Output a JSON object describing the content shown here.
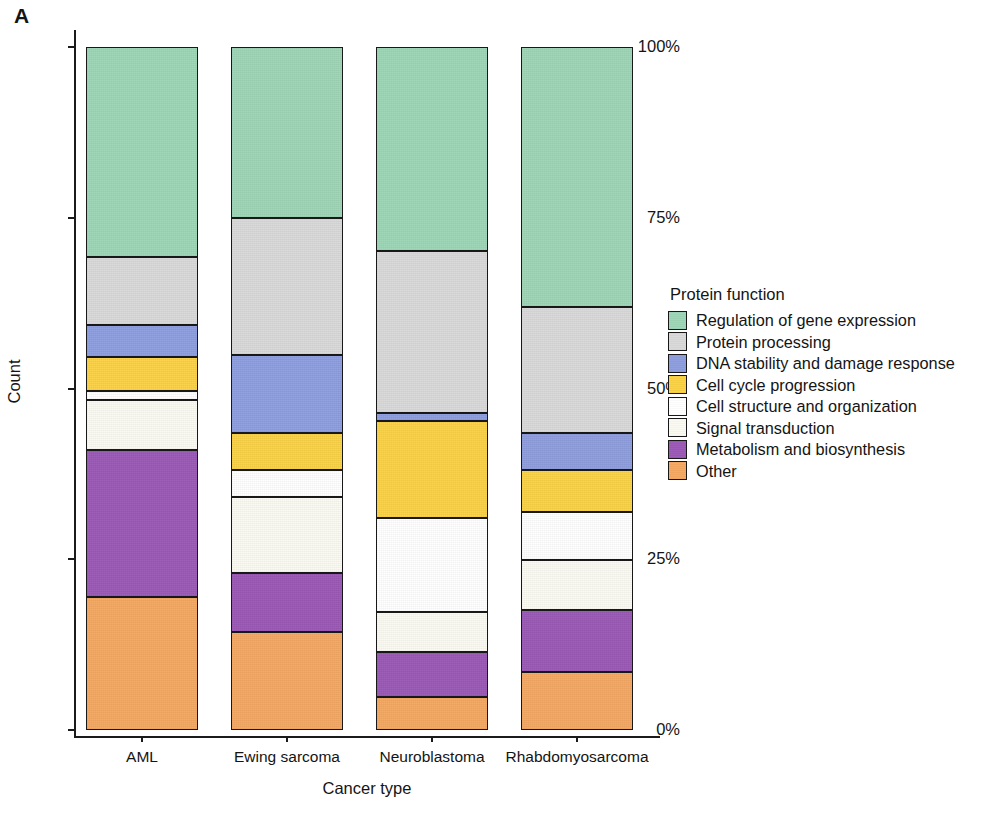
{
  "panel": {
    "letter": "A"
  },
  "axes": {
    "x_title": "Cancer type",
    "y_title": "Count",
    "y_ticks": [
      "100%",
      "75%",
      "50%",
      "25%",
      "0%"
    ],
    "x_ticks": [
      "AML",
      "Ewing sarcoma",
      "Neuroblastoma",
      "Rhabdomyosarcoma"
    ]
  },
  "legend": {
    "title": "Protein function",
    "items": [
      {
        "label": "Regulation of gene expression",
        "color": "#9ed6b6"
      },
      {
        "label": "Protein processing",
        "color": "#d9d9d9"
      },
      {
        "label": "DNA stability and damage response",
        "color": "#8e9ede"
      },
      {
        "label": "Cell cycle progression",
        "color": "#fbd245"
      },
      {
        "label": "Cell structure and organization",
        "color": "#ffffff"
      },
      {
        "label": "Signal transduction",
        "color": "#fbfaf2"
      },
      {
        "label": "Metabolism and biosynthesis",
        "color": "#9b59b6"
      },
      {
        "label": "Other",
        "color": "#f5a862"
      }
    ]
  },
  "chart_data": {
    "type": "bar",
    "stacked": true,
    "normalized": true,
    "title": "",
    "xlabel": "Cancer type",
    "ylabel": "Count",
    "ylim": [
      0,
      100
    ],
    "ytick_values": [
      0,
      25,
      50,
      75,
      100
    ],
    "ytick_labels": [
      "0%",
      "25%",
      "50%",
      "75%",
      "100%"
    ],
    "grid": false,
    "legend_position": "right",
    "legend_title": "Protein function",
    "categories": [
      "AML",
      "Ewing sarcoma",
      "Neuroblastoma",
      "Rhabdomyosarcoma"
    ],
    "series": [
      {
        "name": "Regulation of gene expression",
        "color": "#9ed6b6",
        "values": [
          30.7,
          25.0,
          29.9,
          38.0
        ]
      },
      {
        "name": "Protein processing",
        "color": "#d9d9d9",
        "values": [
          10.0,
          20.1,
          23.7,
          18.5
        ]
      },
      {
        "name": "DNA stability and damage response",
        "color": "#8e9ede",
        "values": [
          4.7,
          11.4,
          1.2,
          5.4
        ]
      },
      {
        "name": "Cell cycle progression",
        "color": "#fbd245",
        "values": [
          5.0,
          5.5,
          14.2,
          6.2
        ]
      },
      {
        "name": "Cell structure and organization",
        "color": "#ffffff",
        "values": [
          1.3,
          3.9,
          13.7,
          7.0
        ]
      },
      {
        "name": "Signal transduction",
        "color": "#fbfaf2",
        "values": [
          7.3,
          11.1,
          5.9,
          7.3
        ]
      },
      {
        "name": "Metabolism and biosynthesis",
        "color": "#9b59b6",
        "values": [
          21.5,
          8.7,
          6.6,
          9.1
        ]
      },
      {
        "name": "Other",
        "color": "#f5a862",
        "values": [
          19.5,
          14.3,
          4.8,
          8.5
        ]
      }
    ]
  },
  "scan_artifact": {
    "text": ""
  }
}
